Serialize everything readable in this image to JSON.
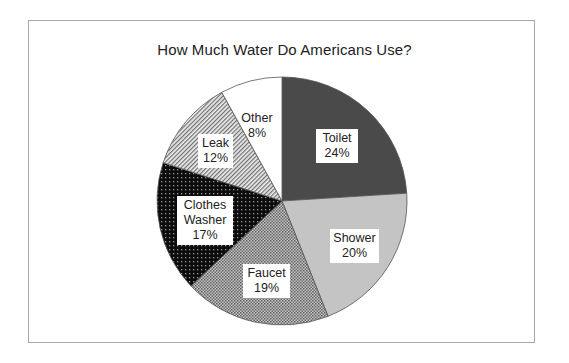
{
  "chart_data": {
    "type": "pie",
    "title": "How Much Water Do Americans Use?",
    "categories": [
      "Toilet",
      "Shower",
      "Faucet",
      "Clothes Washer",
      "Leak",
      "Other"
    ],
    "values": [
      24,
      20,
      19,
      17,
      12,
      8
    ],
    "unit": "%",
    "start_angle": "12 o'clock",
    "direction": "clockwise",
    "legend": "none (labels inside slices)",
    "slices": [
      {
        "name": "Toilet",
        "value": 24,
        "label": "24%",
        "fill": "dark gray solid",
        "color": "#4a4a4a"
      },
      {
        "name": "Shower",
        "value": 20,
        "label": "20%",
        "fill": "light gray solid",
        "color": "#c4c4c4"
      },
      {
        "name": "Faucet",
        "value": 19,
        "label": "19%",
        "fill": "gray checker/dot pattern",
        "color": "#9a9a9a"
      },
      {
        "name": "Clothes Washer",
        "value": 17,
        "label": "17%",
        "fill": "black with white dots",
        "color": "#111111"
      },
      {
        "name": "Leak",
        "value": 12,
        "label": "12%",
        "fill": "diagonal hatch",
        "color": "#b0b0b0"
      },
      {
        "name": "Other",
        "value": 8,
        "label": "8%",
        "fill": "white",
        "color": "#ffffff"
      }
    ]
  },
  "labels": {
    "toilet": {
      "name": "Toilet",
      "pct": "24%"
    },
    "shower": {
      "name": "Shower",
      "pct": "20%"
    },
    "faucet": {
      "name": "Faucet",
      "pct": "19%"
    },
    "washer": {
      "line1": "Clothes",
      "line2": "Washer",
      "pct": "17%"
    },
    "leak": {
      "name": "Leak",
      "pct": "12%"
    },
    "other": {
      "name": "Other",
      "pct": "8%"
    }
  }
}
